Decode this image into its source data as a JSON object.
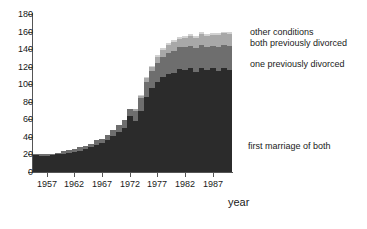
{
  "chart_data": {
    "type": "bar",
    "subtype": "stacked-bar",
    "title": "",
    "xlabel": "year",
    "ylabel": "",
    "ylim": [
      0,
      180
    ],
    "ytick_step": 20,
    "yticks": [
      0,
      20,
      40,
      60,
      80,
      100,
      120,
      140,
      160,
      180
    ],
    "xticks": [
      1957,
      1962,
      1967,
      1972,
      1977,
      1982,
      1987
    ],
    "xlim": [
      1955,
      1990
    ],
    "grid": false,
    "legend_position": "right-inline",
    "colors": {
      "first_marriage_of_both": "#2b2b2b",
      "one_previously_divorced": "#6e6e6e",
      "both_previously_divorced": "#a8a8a8",
      "other_conditions": "#d2d2d2",
      "axis": "#555555",
      "text": "#1a1a1a",
      "background": "#ffffff"
    },
    "categories": [
      1955,
      1956,
      1957,
      1958,
      1959,
      1960,
      1961,
      1962,
      1963,
      1964,
      1965,
      1966,
      1967,
      1968,
      1969,
      1970,
      1971,
      1972,
      1973,
      1974,
      1975,
      1976,
      1977,
      1978,
      1979,
      1980,
      1981,
      1982,
      1983,
      1984,
      1985,
      1986,
      1987,
      1988,
      1989,
      1990
    ],
    "series": [
      {
        "name": "first marriage of both",
        "color": "#2b2b2b",
        "values": [
          19,
          18,
          18,
          19,
          20,
          21,
          22,
          23,
          24,
          26,
          28,
          31,
          33,
          36,
          41,
          46,
          50,
          64,
          58,
          70,
          86,
          96,
          103,
          108,
          112,
          113,
          117,
          116,
          119,
          114,
          119,
          116,
          118,
          115,
          118,
          116
        ]
      },
      {
        "name": "one previously divorced",
        "color": "#6e6e6e",
        "values": [
          2,
          2,
          2,
          2,
          2,
          3,
          3,
          3,
          4,
          4,
          4,
          5,
          5,
          6,
          7,
          8,
          9,
          8,
          12,
          14,
          17,
          19,
          21,
          23,
          24,
          25,
          25,
          26,
          25,
          27,
          26,
          27,
          26,
          28,
          27,
          28
        ]
      },
      {
        "name": "both previously divorced",
        "color": "#a8a8a8",
        "values": [
          0,
          0,
          0,
          0,
          0,
          0,
          0,
          0,
          0,
          0,
          0,
          0,
          0,
          0,
          0,
          0,
          0,
          0,
          2,
          3,
          4,
          5,
          7,
          8,
          9,
          10,
          10,
          11,
          11,
          12,
          12,
          12,
          12,
          13,
          13,
          13
        ]
      },
      {
        "name": "other conditions",
        "color": "#d2d2d2",
        "values": [
          0,
          0,
          0,
          0,
          0,
          0,
          0,
          0,
          0,
          0,
          0,
          0,
          0,
          0,
          0,
          0,
          0,
          0,
          0,
          1,
          1,
          1,
          2,
          2,
          2,
          2,
          2,
          2,
          2,
          2,
          2,
          2,
          2,
          2,
          2,
          2
        ]
      }
    ]
  },
  "legend": {
    "other_conditions": "other conditions",
    "both_previously_divorced": "both previously divorced",
    "one_previously_divorced": "one previously divorced",
    "first_marriage_of_both": "first marriage of both"
  },
  "axis": {
    "xlabel": "year"
  }
}
